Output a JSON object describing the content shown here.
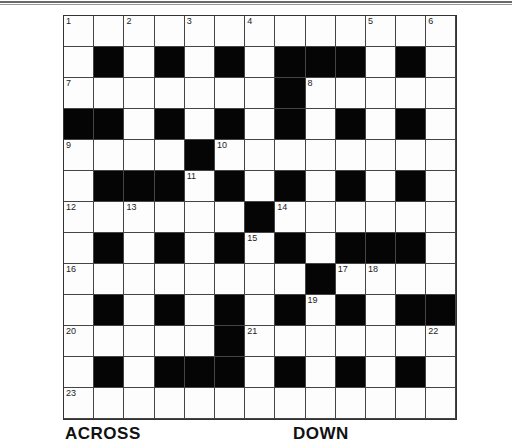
{
  "puzzle": {
    "rows": 13,
    "cols": 13,
    "layout": [
      "WWWWWWWWWWWWW",
      "WBWBWBWBBBWBW",
      "WWWWWWWBWWWWW",
      "BBWBWBWBWBWBW",
      "WWWWBWWWWWWWW",
      "WBBBWBWBWBWBW",
      "WWWWWWBWWWWWW",
      "WBWBWBWBWBBBW",
      "WWWWWWWWBWWWW",
      "WBWBWBWBWBWBB",
      "WWWWWBWWWWWWW",
      "WBWBBBWBWBWBW",
      "WWWWWWWWWWWWW"
    ],
    "numbers": [
      {
        "r": 0,
        "c": 0,
        "n": "1"
      },
      {
        "r": 0,
        "c": 2,
        "n": "2"
      },
      {
        "r": 0,
        "c": 4,
        "n": "3"
      },
      {
        "r": 0,
        "c": 6,
        "n": "4"
      },
      {
        "r": 0,
        "c": 10,
        "n": "5"
      },
      {
        "r": 0,
        "c": 12,
        "n": "6"
      },
      {
        "r": 2,
        "c": 0,
        "n": "7"
      },
      {
        "r": 2,
        "c": 8,
        "n": "8"
      },
      {
        "r": 4,
        "c": 0,
        "n": "9"
      },
      {
        "r": 4,
        "c": 5,
        "n": "10"
      },
      {
        "r": 5,
        "c": 4,
        "n": "11"
      },
      {
        "r": 6,
        "c": 0,
        "n": "12"
      },
      {
        "r": 6,
        "c": 2,
        "n": "13"
      },
      {
        "r": 6,
        "c": 7,
        "n": "14"
      },
      {
        "r": 7,
        "c": 6,
        "n": "15"
      },
      {
        "r": 8,
        "c": 0,
        "n": "16"
      },
      {
        "r": 8,
        "c": 9,
        "n": "17"
      },
      {
        "r": 8,
        "c": 10,
        "n": "18"
      },
      {
        "r": 9,
        "c": 8,
        "n": "19"
      },
      {
        "r": 10,
        "c": 0,
        "n": "20"
      },
      {
        "r": 10,
        "c": 6,
        "n": "21"
      },
      {
        "r": 10,
        "c": 12,
        "n": "22"
      },
      {
        "r": 12,
        "c": 0,
        "n": "23"
      }
    ]
  },
  "headings": {
    "across": "ACROSS",
    "down": "DOWN"
  }
}
